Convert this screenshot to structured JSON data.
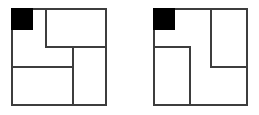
{
  "figure": {
    "title": "Two partitioned squares with shaded corner cell",
    "background_color": "#ffffff",
    "line_color": "#3d3d3d",
    "fill_color": "#000000",
    "stroke_width_px": 2,
    "panel_count": 2,
    "panels": [
      {
        "id": "left-panel",
        "label": "",
        "outer": {
          "x": 11,
          "y": 8,
          "width": 96,
          "height": 98
        },
        "shaded_cell": {
          "x": 11,
          "y": 8,
          "width": 22,
          "height": 22,
          "color": "#000000"
        },
        "dividers": [
          {
            "orientation": "vertical",
            "x": 45,
            "y": 8,
            "length": 40
          },
          {
            "orientation": "horizontal",
            "x": 45,
            "y": 46,
            "length": 62
          },
          {
            "orientation": "vertical",
            "x": 72,
            "y": 46,
            "length": 60
          },
          {
            "orientation": "horizontal",
            "x": 11,
            "y": 66,
            "length": 61
          }
        ],
        "cell_count": 4
      },
      {
        "id": "right-panel",
        "label": "",
        "outer": {
          "x": 153,
          "y": 8,
          "width": 95,
          "height": 98
        },
        "shaded_cell": {
          "x": 153,
          "y": 8,
          "width": 22,
          "height": 22,
          "color": "#000000"
        },
        "dividers": [
          {
            "orientation": "vertical",
            "x": 210,
            "y": 8,
            "length": 60
          },
          {
            "orientation": "horizontal",
            "x": 210,
            "y": 66,
            "length": 38
          },
          {
            "orientation": "horizontal",
            "x": 153,
            "y": 46,
            "length": 38
          },
          {
            "orientation": "vertical",
            "x": 189,
            "y": 46,
            "length": 60
          }
        ],
        "cell_count": 4
      }
    ]
  }
}
